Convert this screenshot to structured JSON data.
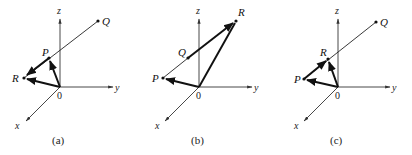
{
  "figure": {
    "panels": [
      {
        "caption": "(a)",
        "axes": {
          "x": "x",
          "y": "y",
          "z": "z",
          "origin": "0"
        },
        "points": {
          "P": "P",
          "Q": "Q",
          "R": "R"
        },
        "description": "Line through R, P, Q; vectors O→P, O→R and P→R"
      },
      {
        "caption": "(b)",
        "axes": {
          "x": "x",
          "y": "y",
          "z": "z",
          "origin": "0"
        },
        "points": {
          "P": "P",
          "Q": "Q",
          "R": "R"
        },
        "description": "Line through P, Q, R; vectors O→P, O→R and Q→R"
      },
      {
        "caption": "(c)",
        "axes": {
          "x": "x",
          "y": "y",
          "z": "z",
          "origin": "0"
        },
        "points": {
          "P": "P",
          "Q": "Q",
          "R": "R"
        },
        "description": "Line through P, R, Q; vectors O→P, O→R and P→R"
      }
    ]
  }
}
